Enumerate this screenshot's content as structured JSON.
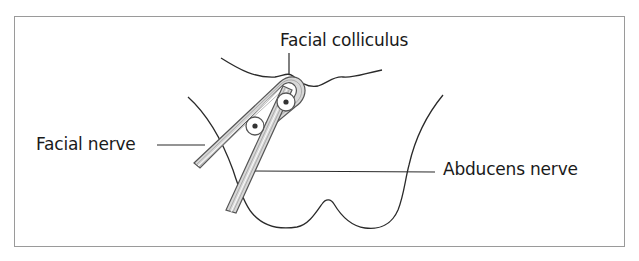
{
  "figure": {
    "labels": {
      "facial_colliculus": "Facial colliculus",
      "facial_nerve": "Facial nerve",
      "abducens_nerve": "Abducens nerve"
    },
    "structures": [
      {
        "id": "floor-of-fourth-ventricle",
        "kind": "outline"
      },
      {
        "id": "pons-outline",
        "kind": "outline"
      },
      {
        "id": "facial-nerve",
        "kind": "nerve-bundle"
      },
      {
        "id": "abducens-nerve",
        "kind": "nerve-bundle"
      },
      {
        "id": "abducens-nucleus",
        "kind": "nucleus"
      },
      {
        "id": "facial-nucleus",
        "kind": "nucleus"
      }
    ],
    "colors": {
      "line": "#2a2a2a",
      "nerve_fill": "#d8d8d8",
      "nerve_stroke": "#555555",
      "frame": "#9a9a9a"
    }
  }
}
